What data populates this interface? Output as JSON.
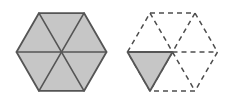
{
  "diagram": {
    "canvas": {
      "width": 228,
      "height": 100,
      "background": "#ffffff"
    },
    "colors": {
      "fill_shaded": "#c6c6c6",
      "fill_empty": "#ffffff",
      "stroke_solid": "#555555",
      "stroke_dashed": "#4d4d4d"
    },
    "stroke": {
      "solid_width": 1.6,
      "dashed_width": 1.5,
      "dash_pattern": "5 4"
    },
    "figures": [
      {
        "id": "figure-left",
        "label": "Whole hexagon shaded",
        "center": {
          "x": 61.5,
          "y": 52
        },
        "radius": 45,
        "orientation": "flat-left-right-vertices",
        "vertices": [
          {
            "x": 106.5,
            "y": 52.0
          },
          {
            "x": 84.0,
            "y": 90.97
          },
          {
            "x": 39.0,
            "y": 90.97
          },
          {
            "x": 16.5,
            "y": 52.0
          },
          {
            "x": 39.0,
            "y": 13.03
          },
          {
            "x": 84.0,
            "y": 13.03
          }
        ],
        "triangles": [
          {
            "id": "L1",
            "position": "right-upper",
            "shaded": true,
            "style": "solid"
          },
          {
            "id": "L2",
            "position": "top",
            "shaded": true,
            "style": "solid"
          },
          {
            "id": "L3",
            "position": "left-upper",
            "shaded": true,
            "style": "solid"
          },
          {
            "id": "L4",
            "position": "left-lower",
            "shaded": true,
            "style": "solid"
          },
          {
            "id": "L5",
            "position": "bottom",
            "shaded": true,
            "style": "solid"
          },
          {
            "id": "L6",
            "position": "right-lower",
            "shaded": true,
            "style": "solid"
          }
        ],
        "shaded_count": 6,
        "total_count": 6
      },
      {
        "id": "figure-right",
        "label": "Hexagon outlined dashed with one shaded triangle",
        "center": {
          "x": 172.5,
          "y": 52
        },
        "radius": 45,
        "orientation": "flat-left-right-vertices",
        "vertices": [
          {
            "x": 217.5,
            "y": 52.0
          },
          {
            "x": 195.0,
            "y": 90.97
          },
          {
            "x": 150.0,
            "y": 90.97
          },
          {
            "x": 127.5,
            "y": 52.0
          },
          {
            "x": 150.0,
            "y": 13.03
          },
          {
            "x": 195.0,
            "y": 13.03
          }
        ],
        "triangles": [
          {
            "id": "R1",
            "position": "right-upper",
            "shaded": false,
            "style": "dashed"
          },
          {
            "id": "R2",
            "position": "top",
            "shaded": false,
            "style": "dashed"
          },
          {
            "id": "R3",
            "position": "left-upper",
            "shaded": true,
            "style": "solid"
          },
          {
            "id": "R4",
            "position": "left-lower",
            "shaded": false,
            "style": "dashed"
          },
          {
            "id": "R5",
            "position": "bottom",
            "shaded": false,
            "style": "dashed"
          },
          {
            "id": "R6",
            "position": "right-lower",
            "shaded": false,
            "style": "dashed"
          }
        ],
        "shaded_count": 1,
        "total_count": 6
      }
    ]
  }
}
